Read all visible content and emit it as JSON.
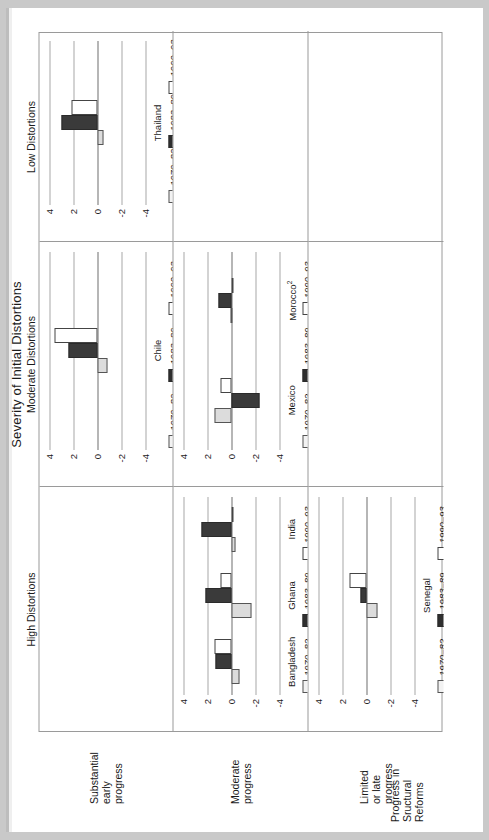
{
  "figure": {
    "column_super_header": "Severity of Initial Distortions",
    "row_super_header": "Progress in\nSructural\nReforms",
    "row_super_header_lines": [
      "Progress in",
      "Sructural",
      "Reforms"
    ],
    "column_headers": [
      "High Distortions",
      "Moderate Distortions",
      "Low Distortions"
    ],
    "row_headers": [
      "Substantial\nearly\nprogress",
      "Moderate\nprogress",
      "Limited\nor late\nprogress"
    ],
    "row_header_lines": [
      [
        "Substantial",
        "early",
        "progress"
      ],
      [
        "Moderate",
        "progress"
      ],
      [
        "Limited",
        "or late",
        "progress"
      ]
    ]
  },
  "legend": {
    "entries": [
      {
        "label": "1970–82",
        "swatch": "light-gray",
        "color": "#f2f2f2"
      },
      {
        "label": "1983–89",
        "swatch": "black",
        "color": "#2e2e2e"
      },
      {
        "label": "1990–93",
        "swatch": "white",
        "color": "#ffffff"
      }
    ]
  },
  "axis": {
    "ticks": [
      "4",
      "2",
      "0",
      "-2",
      "-4"
    ],
    "tick_values": [
      4,
      2,
      0,
      -2,
      -4
    ],
    "ylim": [
      -4,
      4
    ]
  },
  "chart_data": {
    "type": "bar",
    "xlabel": "",
    "ylabel": "",
    "ylim": [
      -4,
      4
    ],
    "grid": true,
    "legend_position": "below-panel",
    "series_names": [
      "1970–82",
      "1983–89",
      "1990–93"
    ],
    "panels": [
      {
        "row": "Substantial early progress",
        "column": "High Distortions",
        "empty": true,
        "categories": [],
        "series": []
      },
      {
        "row": "Substantial early progress",
        "column": "Moderate Distortions",
        "empty": false,
        "categories": [
          "Chile"
        ],
        "series": [
          {
            "name": "1970–82",
            "values": [
              -0.8
            ]
          },
          {
            "name": "1983–89",
            "values": [
              2.4
            ]
          },
          {
            "name": "1990–93",
            "values": [
              3.6
            ]
          }
        ]
      },
      {
        "row": "Substantial early progress",
        "column": "Low Distortions",
        "empty": false,
        "categories": [
          "Thailand"
        ],
        "series": [
          {
            "name": "1970–82",
            "values": [
              -0.5
            ]
          },
          {
            "name": "1983–89",
            "values": [
              3.0
            ]
          },
          {
            "name": "1990–93",
            "values": [
              2.2
            ]
          }
        ]
      },
      {
        "row": "Moderate progress",
        "column": "High Distortions",
        "empty": false,
        "categories": [
          "Bangladesh",
          "Ghana",
          "India"
        ],
        "series": [
          {
            "name": "1970–82",
            "values": [
              -0.7,
              -1.7,
              -0.3
            ]
          },
          {
            "name": "1983–89",
            "values": [
              1.3,
              2.2,
              2.5
            ]
          },
          {
            "name": "1990–93",
            "values": [
              1.4,
              0.9,
              0.0
            ]
          }
        ]
      },
      {
        "row": "Moderate progress",
        "column": "Moderate Distortions",
        "empty": false,
        "categories": [
          "Mexico",
          "Morocco²"
        ],
        "series": [
          {
            "name": "1970–82",
            "values": [
              1.4,
              0.1
            ]
          },
          {
            "name": "1983–89",
            "values": [
              -2.3,
              1.1
            ]
          },
          {
            "name": "1990–93",
            "values": [
              0.9,
              -0.1
            ]
          }
        ]
      },
      {
        "row": "Moderate progress",
        "column": "Low Distortions",
        "empty": true,
        "categories": [],
        "series": []
      },
      {
        "row": "Limited or late progress",
        "column": "High Distortions",
        "empty": false,
        "categories": [
          "Senegal"
        ],
        "series": [
          {
            "name": "1970–82",
            "values": [
              -0.9
            ]
          },
          {
            "name": "1983–89",
            "values": [
              0.5
            ]
          },
          {
            "name": "1990–93",
            "values": [
              1.4
            ]
          }
        ]
      },
      {
        "row": "Limited or late progress",
        "column": "Moderate Distortions",
        "empty": true,
        "categories": [],
        "series": []
      },
      {
        "row": "Limited or late progress",
        "column": "Low Distortions",
        "empty": true,
        "categories": [],
        "series": []
      }
    ]
  }
}
